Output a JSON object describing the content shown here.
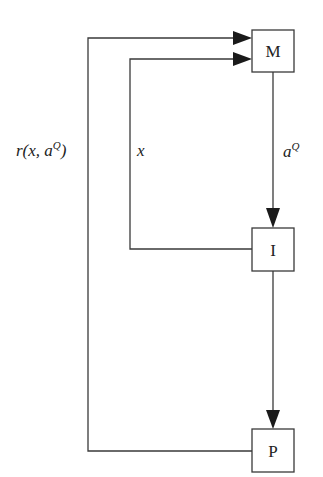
{
  "diagram": {
    "colors": {
      "stroke": "#3a3a3a",
      "fill": "#ffffff",
      "text": "#222222",
      "arrow": "#1a1a1a"
    },
    "nodes": [
      {
        "id": "M",
        "label": "M"
      },
      {
        "id": "I",
        "label": "I"
      },
      {
        "id": "P",
        "label": "P"
      }
    ],
    "edges": [
      {
        "from": "M",
        "to": "I",
        "label_base": "a",
        "label_sup": "Q"
      },
      {
        "from": "I",
        "to": "M",
        "label_base": "x",
        "label_sup": ""
      },
      {
        "from": "I",
        "to": "P",
        "label_base": "",
        "label_sup": ""
      },
      {
        "from": "P",
        "to": "M",
        "label_base": "r(x, a",
        "label_sup": "Q",
        "label_tail": ")"
      }
    ]
  }
}
